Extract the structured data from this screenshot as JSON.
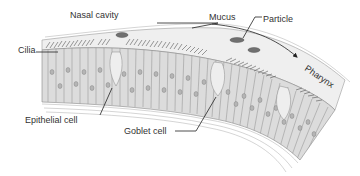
{
  "diagram": {
    "labels": {
      "nasal_cavity": "Nasal cavity",
      "mucus": "Mucus",
      "particle": "Particle",
      "cilia": "Cilia",
      "pharynx": "Pharynx",
      "epithelial_cell": "Epithelial cell",
      "goblet_cell": "Goblet cell"
    },
    "arrow": {
      "direction": "toward-pharynx"
    },
    "colors": {
      "text": "#333333",
      "line": "#222222",
      "cell_fill": "#d9d9d9",
      "cell_stroke": "#8a8a8a",
      "mucus_fill": "#ececec",
      "cilia": "#555555",
      "particle": "#6a6a6a"
    }
  }
}
